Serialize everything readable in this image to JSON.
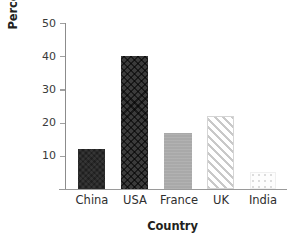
{
  "chart_data": {
    "type": "bar",
    "title": "",
    "xlabel": "Country",
    "ylabel": "Percentage",
    "categories": [
      "China",
      "USA",
      "France",
      "UK",
      "India"
    ],
    "values": [
      12,
      40,
      17,
      22,
      5
    ],
    "ylim": [
      0,
      50
    ],
    "yticks": [
      10,
      20,
      30,
      40,
      50
    ],
    "ytick_labels": [
      "10",
      "20",
      "30",
      "40",
      "50"
    ],
    "grid": false,
    "legend": "none",
    "series": [
      {
        "name": "Percentage",
        "values": [
          12,
          40,
          17,
          22,
          5
        ]
      }
    ],
    "bar_styles": [
      {
        "category": "China",
        "fill": "#1f1f1f",
        "pattern": "solid-dark"
      },
      {
        "category": "USA",
        "fill": "#3b3b3b",
        "pattern": "crosshatch"
      },
      {
        "category": "France",
        "fill": "#a9a9a9",
        "pattern": "solid-gray"
      },
      {
        "category": "UK",
        "fill": "#ffffff",
        "pattern": "diagonal-stripes"
      },
      {
        "category": "India",
        "fill": "#fdfdfd",
        "pattern": "dots"
      }
    ],
    "colors": {
      "axis": "#8c8c8c",
      "text": "#231f20",
      "background": "#ffffff"
    }
  }
}
